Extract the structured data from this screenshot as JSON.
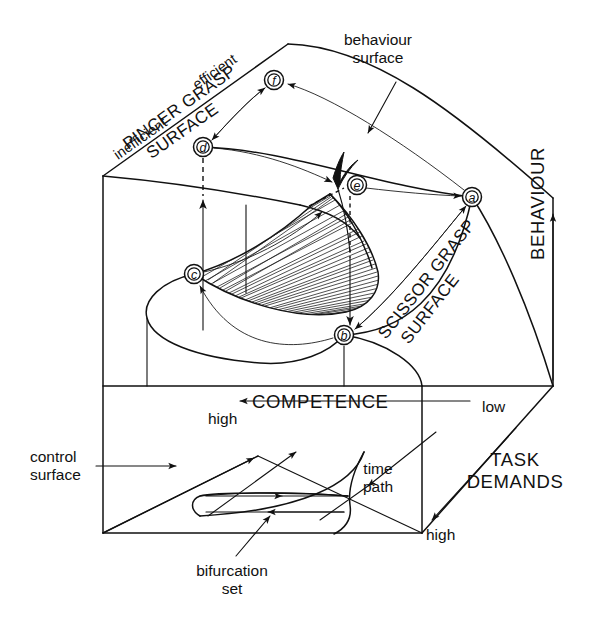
{
  "figure": {
    "kind": "cusp-catastrophe-diagram",
    "title_visible": false,
    "background": "#ffffff",
    "ink": "#111111"
  },
  "labels": {
    "behaviour_surface_l1": "behaviour",
    "behaviour_surface_l2": "surface",
    "pincer_grasp_l1": "PINCER GRASP",
    "pincer_grasp_l2": "SURFACE",
    "scissor_grasp_l1": "SCISSOR GRASP",
    "scissor_grasp_l2": "SURFACE",
    "inefficient": "inefficient",
    "efficient": "efficient",
    "competence": "COMPETENCE",
    "behaviour_axis": "BEHAVIOUR",
    "task_demands_l1": "TASK",
    "task_demands_l2": "DEMANDS",
    "control_surface_l1": "control",
    "control_surface_l2": "surface",
    "bifurcation_set_l1": "bifurcation",
    "bifurcation_set_l2": "set",
    "time_path_l1": "time",
    "time_path_l2": "path",
    "competence_high": "high",
    "competence_low": "low",
    "task_demands_high": "high"
  },
  "nodes": [
    {
      "id": "a",
      "label": "a",
      "x": 472,
      "y": 197
    },
    {
      "id": "b",
      "label": "b",
      "x": 344,
      "y": 335
    },
    {
      "id": "c",
      "label": "c",
      "x": 194,
      "y": 274
    },
    {
      "id": "d",
      "label": "d",
      "x": 203,
      "y": 147
    },
    {
      "id": "e",
      "label": "e",
      "x": 357,
      "y": 185
    },
    {
      "id": "f",
      "label": "f",
      "x": 274,
      "y": 80
    }
  ],
  "axes": {
    "competence": {
      "name": "COMPETENCE",
      "high_end": "high",
      "low_end": "low",
      "direction": "right-to-left"
    },
    "behaviour": {
      "name": "BEHAVIOUR",
      "low_end": "inefficient",
      "high_end": "efficient",
      "direction": "upward"
    },
    "task_demands": {
      "name": "TASK DEMANDS",
      "far_end": "high",
      "direction": "toward-viewer"
    }
  },
  "annotations": [
    {
      "name": "behaviour-surface",
      "text": "behaviour surface"
    },
    {
      "name": "control-surface",
      "text": "control surface"
    },
    {
      "name": "bifurcation-set",
      "text": "bifurcation set"
    },
    {
      "name": "time-path",
      "text": "time path"
    }
  ],
  "regions": [
    {
      "name": "pincer-grasp-surface",
      "text": "PINCER GRASP SURFACE"
    },
    {
      "name": "scissor-grasp-surface",
      "text": "SCISSOR GRASP SURFACE"
    }
  ]
}
